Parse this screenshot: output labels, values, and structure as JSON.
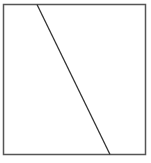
{
  "diagram": {
    "shapes": [
      {
        "type": "rect",
        "name": "square",
        "x": 3.5,
        "y": 4.5,
        "width": 142,
        "height": 150,
        "stroke": "#555555"
      },
      {
        "type": "line",
        "name": "diagonal",
        "x1": 37,
        "y1": 4.5,
        "x2": 110,
        "y2": 154.5,
        "stroke": "#333333"
      }
    ]
  }
}
